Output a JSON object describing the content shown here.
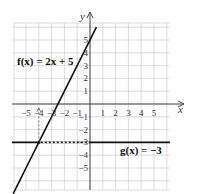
{
  "chart_data": {
    "type": "line",
    "title": "",
    "xlabel": "x",
    "ylabel": "y",
    "xlim": [
      -5.8,
      6.2
    ],
    "ylim": [
      -6.5,
      6.5
    ],
    "grid": true,
    "x_ticks": [
      "-5",
      "-4",
      "-3",
      "-2",
      "-1",
      "1",
      "2",
      "3",
      "4",
      "5"
    ],
    "y_ticks": [
      "5",
      "4",
      "3",
      "2",
      "1",
      "-1",
      "-2",
      "-3",
      "-4",
      "-5"
    ],
    "series": [
      {
        "name": "f(x) = 2x + 5",
        "label": "f(x) = 2x + 5",
        "slope": 2,
        "intercept": 5,
        "x": [
          -6,
          0.5
        ],
        "y": [
          -7,
          6
        ]
      },
      {
        "name": "g(x) = -3",
        "label": "g(x) = −3",
        "slope": 0,
        "intercept": -3,
        "x": [
          -5.8,
          6
        ],
        "y": [
          -3,
          -3
        ]
      }
    ],
    "annotations": [
      {
        "type": "intersection",
        "x": -4,
        "y": -3
      },
      {
        "type": "dashed-arrow",
        "from": [
          -4,
          -3
        ],
        "to": [
          -4,
          -0.3
        ],
        "note": "points to x = -4"
      },
      {
        "type": "dashed-line",
        "from": [
          -4,
          -3
        ],
        "to": [
          0,
          -3
        ]
      }
    ]
  },
  "labels": {
    "x_axis": "x",
    "y_axis": "y",
    "f_label": "f(x) = 2x + 5",
    "g_label": "g(x) = −3"
  }
}
